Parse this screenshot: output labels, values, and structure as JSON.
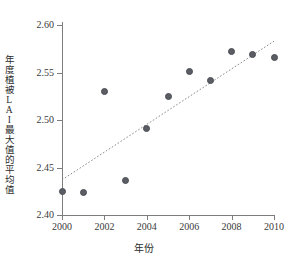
{
  "chart_data": {
    "type": "scatter",
    "title": "",
    "xlabel": "年份",
    "ylabel": "年度植被LAI最大值的平均值",
    "xlim": [
      2000,
      2010
    ],
    "ylim": [
      2.4,
      2.6
    ],
    "xticks": [
      "2000",
      "2002",
      "2004",
      "2006",
      "2008",
      "2010"
    ],
    "xtick_values": [
      2000,
      2002,
      2004,
      2006,
      2008,
      2010
    ],
    "yticks": [
      "2.40",
      "2.45",
      "2.50",
      "2.55",
      "2.60"
    ],
    "ytick_values": [
      2.4,
      2.45,
      2.5,
      2.55,
      2.6
    ],
    "grid": false,
    "legend": null,
    "x": [
      2000,
      2001,
      2002,
      2003,
      2004,
      2005,
      2006,
      2007,
      2008,
      2009,
      2010
    ],
    "values": [
      2.425,
      2.424,
      2.53,
      2.436,
      2.491,
      2.525,
      2.551,
      2.542,
      2.572,
      2.569,
      2.566
    ],
    "series": [
      {
        "name": "年度植被LAI最大值的平均值",
        "marker": "circle",
        "color": "#5a5d63",
        "points": [
          {
            "x": 2000,
            "y": 2.425
          },
          {
            "x": 2001,
            "y": 2.424
          },
          {
            "x": 2002,
            "y": 2.53
          },
          {
            "x": 2003,
            "y": 2.436
          },
          {
            "x": 2004,
            "y": 2.491
          },
          {
            "x": 2005,
            "y": 2.525
          },
          {
            "x": 2006,
            "y": 2.551
          },
          {
            "x": 2007,
            "y": 2.542
          },
          {
            "x": 2008,
            "y": 2.572
          },
          {
            "x": 2009,
            "y": 2.569
          },
          {
            "x": 2010,
            "y": 2.566
          }
        ]
      }
    ],
    "trendline": {
      "type": "linear",
      "style": "dotted",
      "color": "#8a8a8a",
      "x_start": 2000,
      "y_start": 2.437,
      "x_end": 2010,
      "y_end": 2.583
    },
    "colors": {
      "marker": "#5a5d63",
      "marker_edge": "#4a4d52",
      "axis": "#7d7d7d",
      "trend": "#8a8a8a",
      "text": "#2b2b2b",
      "background": "#ffffff"
    }
  }
}
